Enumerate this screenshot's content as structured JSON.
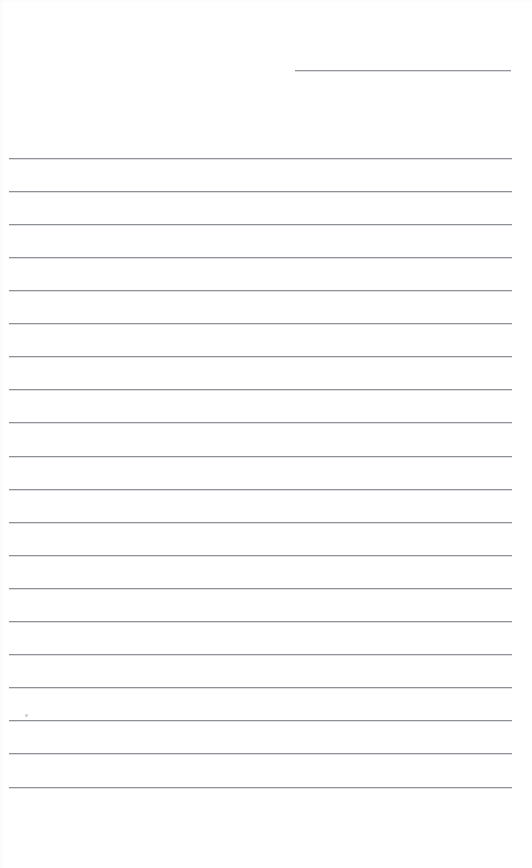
{
  "page": {
    "kind": "blank-lined-paper",
    "width": 532,
    "height": 868,
    "background_color": "#ffffff",
    "rule_color": "#8e9195",
    "rule_thickness_px": 1,
    "content_text": ""
  },
  "header_rule": {
    "name": "header-rule",
    "x": 295,
    "y": 70,
    "width": 216,
    "color": "#94979b"
  },
  "body_rules": [
    {
      "index": 1,
      "x": 9,
      "y": 158,
      "width": 503
    },
    {
      "index": 2,
      "x": 9,
      "y": 191,
      "width": 503
    },
    {
      "index": 3,
      "x": 9,
      "y": 224,
      "width": 503
    },
    {
      "index": 4,
      "x": 9,
      "y": 257,
      "width": 503
    },
    {
      "index": 5,
      "x": 9,
      "y": 290,
      "width": 503
    },
    {
      "index": 6,
      "x": 9,
      "y": 323,
      "width": 503
    },
    {
      "index": 7,
      "x": 9,
      "y": 356,
      "width": 503
    },
    {
      "index": 8,
      "x": 9,
      "y": 389,
      "width": 503
    },
    {
      "index": 9,
      "x": 9,
      "y": 422,
      "width": 503
    },
    {
      "index": 10,
      "x": 9,
      "y": 456,
      "width": 503
    },
    {
      "index": 11,
      "x": 9,
      "y": 489,
      "width": 503
    },
    {
      "index": 12,
      "x": 9,
      "y": 522,
      "width": 503
    },
    {
      "index": 13,
      "x": 9,
      "y": 555,
      "width": 503
    },
    {
      "index": 14,
      "x": 9,
      "y": 588,
      "width": 503
    },
    {
      "index": 15,
      "x": 9,
      "y": 621,
      "width": 503
    },
    {
      "index": 16,
      "x": 9,
      "y": 654,
      "width": 503
    },
    {
      "index": 17,
      "x": 9,
      "y": 687,
      "width": 503
    },
    {
      "index": 18,
      "x": 9,
      "y": 720,
      "width": 503
    },
    {
      "index": 19,
      "x": 9,
      "y": 753,
      "width": 503
    },
    {
      "index": 20,
      "x": 9,
      "y": 787,
      "width": 503
    }
  ],
  "marks": [
    {
      "name": "pencil-speck",
      "x": 25,
      "y": 714,
      "color": "#c9cbcd"
    }
  ]
}
